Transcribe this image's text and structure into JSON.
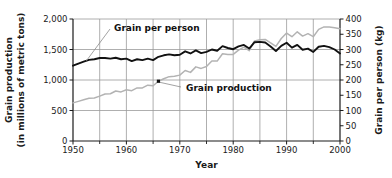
{
  "chart_data": {
    "type": "line",
    "title": "",
    "xlabel": "Year",
    "grid": true,
    "legend_position": "inline-annotations",
    "x": [
      1950,
      1951,
      1952,
      1953,
      1954,
      1955,
      1956,
      1957,
      1958,
      1959,
      1960,
      1961,
      1962,
      1963,
      1964,
      1965,
      1966,
      1967,
      1968,
      1969,
      1970,
      1971,
      1972,
      1973,
      1974,
      1975,
      1976,
      1977,
      1978,
      1979,
      1980,
      1981,
      1982,
      1983,
      1984,
      1985,
      1986,
      1987,
      1988,
      1989,
      1990,
      1991,
      1992,
      1993,
      1994,
      1995,
      1996,
      1997,
      1998,
      1999,
      2000
    ],
    "xlim": [
      1950,
      2000
    ],
    "xticks": [
      1950,
      1960,
      1970,
      1980,
      1990,
      2000
    ],
    "xticklabels": [
      "1950",
      "1960",
      "1970",
      "1980",
      "1990",
      "2000"
    ],
    "xminorticks": [
      1955,
      1965,
      1975,
      1985,
      1995
    ],
    "left_axis": {
      "label_line1": "Grain production",
      "label_line2": "(in millions of metric tons)",
      "ylim": [
        0,
        2000
      ],
      "yticks": [
        0,
        500,
        1000,
        1500,
        2000
      ],
      "yticklabels": [
        "0",
        "500",
        "1,000",
        "1,500",
        "2,000"
      ]
    },
    "right_axis": {
      "label": "Grain per person (kg)",
      "ylim": [
        0,
        400
      ],
      "yticks": [
        0,
        50,
        100,
        150,
        200,
        250,
        300,
        350,
        400
      ],
      "yticklabels": [
        "0",
        "50",
        "100",
        "150",
        "200",
        "250",
        "300",
        "350",
        "400"
      ]
    },
    "series": [
      {
        "name": "Grain production",
        "annotation": "Grain production",
        "axis": "left",
        "unit": "million metric tons",
        "color": "#b3b3b3",
        "values": [
          625,
          650,
          675,
          700,
          705,
          735,
          770,
          775,
          820,
          805,
          840,
          825,
          870,
          870,
          915,
          905,
          980,
          1020,
          1055,
          1060,
          1080,
          1155,
          1125,
          1215,
          1190,
          1220,
          1310,
          1310,
          1430,
          1420,
          1420,
          1490,
          1540,
          1480,
          1640,
          1660,
          1665,
          1610,
          1550,
          1680,
          1770,
          1710,
          1790,
          1720,
          1760,
          1710,
          1830,
          1870,
          1870,
          1855,
          1840
        ]
      },
      {
        "name": "Grain per person",
        "annotation": "Grain per person",
        "axis": "right",
        "unit": "kg",
        "color": "#111111",
        "values": [
          247,
          254,
          260,
          266,
          268,
          272,
          272,
          270,
          273,
          268,
          270,
          262,
          268,
          265,
          270,
          265,
          276,
          281,
          284,
          281,
          283,
          294,
          287,
          297,
          288,
          292,
          300,
          296,
          311,
          305,
          301,
          310,
          315,
          303,
          324,
          325,
          323,
          310,
          295,
          312,
          322,
          306,
          315,
          299,
          303,
          292,
          309,
          312,
          308,
          300,
          287
        ]
      }
    ]
  }
}
